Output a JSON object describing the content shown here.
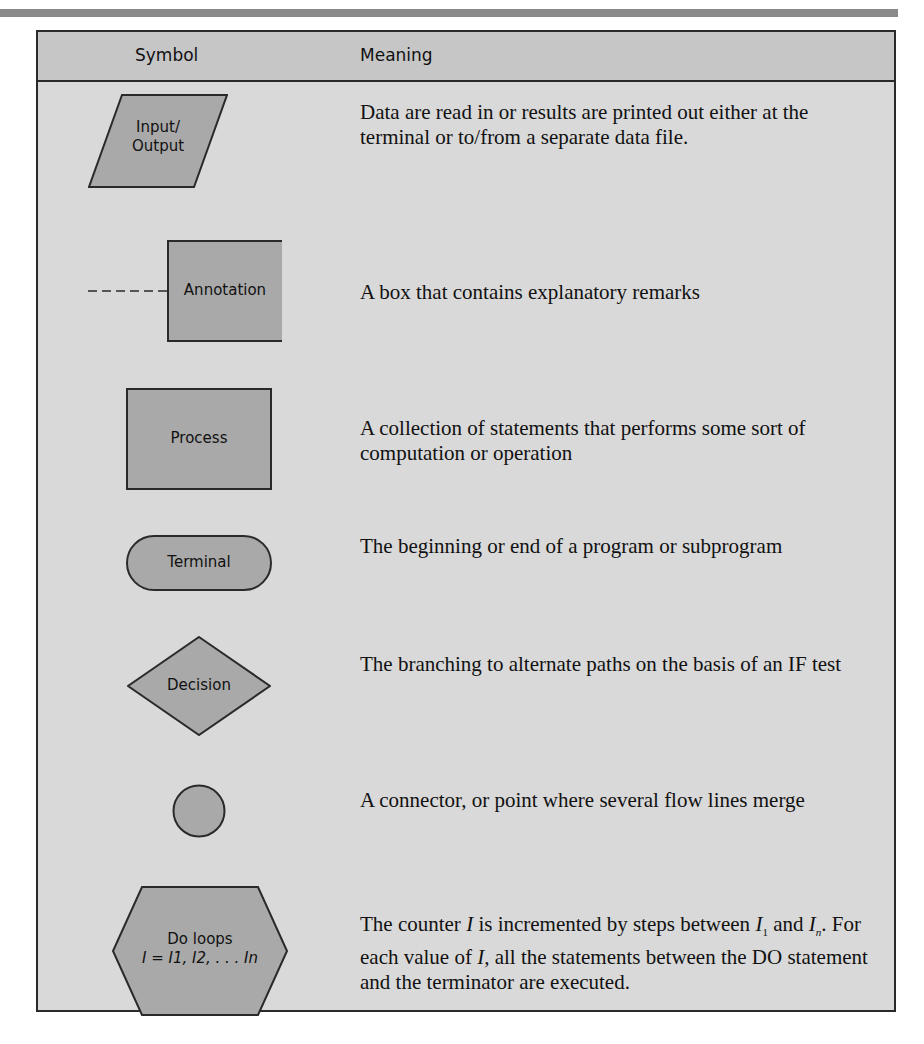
{
  "table": {
    "headers": {
      "symbol": "Symbol",
      "meaning": "Meaning"
    },
    "colors": {
      "header_bg": "#c6c6c6",
      "body_bg": "#d9d9d9",
      "shape_fill": "#a9a9a9",
      "border": "#2a2a2a"
    },
    "rows": [
      {
        "symbol": "input-output-parallelogram",
        "label_line1": "Input/",
        "label_line2": "Output",
        "meaning": "Data are read in or results are printed out either at the terminal or to/from a separate data file."
      },
      {
        "symbol": "annotation-bracket",
        "label": "Annotation",
        "meaning": "A box that contains explanatory remarks"
      },
      {
        "symbol": "process-rectangle",
        "label": "Process",
        "meaning": "A collection of statements that performs some sort of computation or operation"
      },
      {
        "symbol": "terminal-rounded",
        "label": "Terminal",
        "meaning": "The beginning or end of a program or subprogram"
      },
      {
        "symbol": "decision-diamond",
        "label": "Decision",
        "meaning": "The branching to alternate paths on the basis of an IF test"
      },
      {
        "symbol": "connector-circle",
        "label": "",
        "meaning": "A connector, or point where several flow lines merge"
      },
      {
        "symbol": "do-loop-hexagon",
        "label_line1": "Do loops",
        "label_line2": "I = I1, I2, . . . In",
        "meaning_parts": {
          "p1": "The counter ",
          "var_i": "I",
          "p2": " is incremented by steps between ",
          "i1": "I",
          "sub1": "1",
          "p3": " and ",
          "in": "I",
          "subn": "n",
          "p4": ". For each value of ",
          "var_i2": "I,",
          "p5": " all the statements between the DO statement and the terminator are executed."
        }
      }
    ]
  }
}
